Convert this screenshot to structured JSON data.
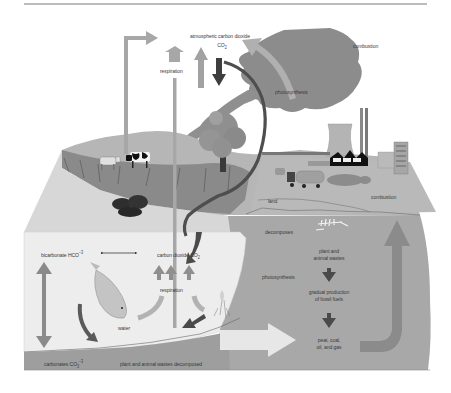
{
  "figure": {
    "colors": {
      "background": "#ffffff",
      "rule": "#7a7a7a",
      "land_top": "#b4b4b4",
      "land_face": "#a2a2a2",
      "water_face": "#ececec",
      "underground": "#a6a6a6",
      "sediment": "#9c9c9c",
      "arrow_light": "#a8a8a8",
      "arrow_mid": "#8e8e8e",
      "arrow_dark": "#4a4a4a",
      "smoke": "#8a8a8a",
      "label_text": "#3a3a3a"
    }
  },
  "labels": {
    "atmospheric": "atmospheric carbon dioxide",
    "atmospheric_formula": "CO",
    "atmospheric_sub": "2",
    "respiration_top": "respiration",
    "photosynthesis_top": "photosynthesis",
    "combustion_cloud": "combustion",
    "combustion_ground": "combustion",
    "land": "land",
    "decomposes": "decomposes",
    "photosynthesis_water": "photosynthesis",
    "plant_animal_wastes_1": "plant and",
    "plant_animal_wastes_2": "animal wastes",
    "gradual_1": "gradual production",
    "gradual_2": "of fossil fuels",
    "fuels_1": "peat, coal,",
    "fuels_2": "oil, and gas",
    "bicarbonate": "bicarbonate HCO",
    "bicarbonate_sup": "−3",
    "carbon_dioxide_water": "carbon dioxide CO",
    "carbon_dioxide_water_sub": "2",
    "respiration_water": "respiration",
    "water": "water",
    "carbonates": "carbonates CO",
    "carbonates_sub": "3",
    "carbonates_sup": "−3",
    "wastes_decomposed": "plant and animal wastes decomposed"
  },
  "icons": [
    "cow-icon",
    "tree-icon",
    "power-plant-icon",
    "cooling-tower-icon",
    "smokestack-icon",
    "building-icon",
    "truck-icon",
    "fish-icon",
    "seaweed-icon",
    "coal-deposit-icon",
    "skeleton-fossil-icon"
  ]
}
